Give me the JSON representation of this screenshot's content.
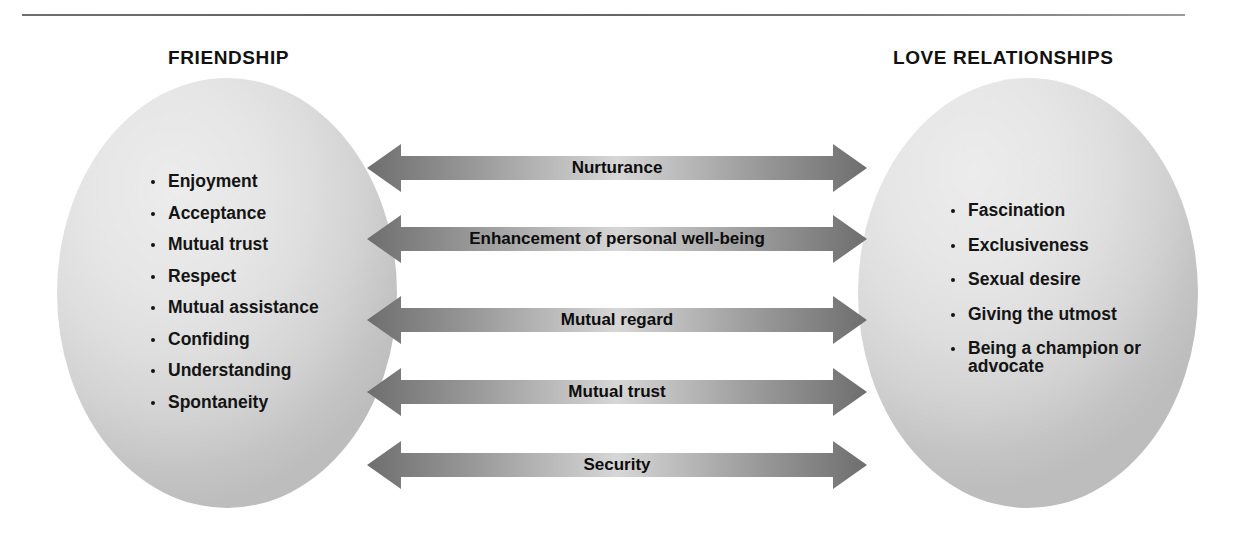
{
  "diagram": {
    "left_group": {
      "title": "FRIENDSHIP",
      "items": [
        "Enjoyment",
        "Acceptance",
        "Mutual trust",
        "Respect",
        "Mutual assistance",
        "Confiding",
        "Understanding",
        "Spontaneity"
      ]
    },
    "right_group": {
      "title": "LOVE RELATIONSHIPS",
      "items": [
        "Fascination",
        "Exclusiveness",
        "Sexual desire",
        "Giving the utmost",
        "Being a champion or advocate"
      ]
    },
    "connectors": [
      {
        "label": "Nurturance"
      },
      {
        "label": "Enhancement of personal well-being"
      },
      {
        "label": "Mutual regard"
      },
      {
        "label": "Mutual trust"
      },
      {
        "label": "Security"
      }
    ],
    "colors": {
      "arrow_dark": "#6e6e6e",
      "arrow_light": "#d8d8d8",
      "circle_fill": "#e3e3e3",
      "text": "#141414",
      "rule": "#6f6f6f"
    }
  }
}
